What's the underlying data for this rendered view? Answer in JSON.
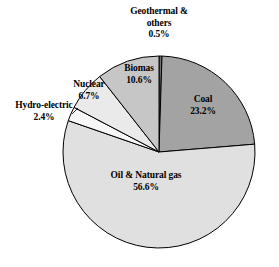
{
  "chart_data": {
    "type": "pie",
    "title": "",
    "subtitle": "",
    "xlabel": "",
    "ylabel": "",
    "legend_position": "none",
    "grid": false,
    "labels_inline": true,
    "unit": "%",
    "start_angle_deg": 0,
    "direction": "clockwise",
    "categories": [
      "Geothermal & others",
      "Coal",
      "Oil & Natural gas",
      "Hydro-electric",
      "Nuclear",
      "Biomas"
    ],
    "values": [
      0.5,
      23.2,
      56.6,
      2.4,
      6.7,
      10.6
    ],
    "slices": [
      {
        "name": "Geothermal & others",
        "label_line1": "Geothermal &",
        "label_line2": "others",
        "value": 0.5,
        "value_text": "0.5%",
        "color": "#6e6e6e",
        "label_placement": "outside-top"
      },
      {
        "name": "Coal",
        "label_line1": "Coal",
        "label_line2": "",
        "value": 23.2,
        "value_text": "23.2%",
        "color": "#a3a3a3",
        "label_placement": "inside"
      },
      {
        "name": "Oil & Natural gas",
        "label_line1": "Oil & Natural gas",
        "label_line2": "",
        "value": 56.6,
        "value_text": "56.6%",
        "color": "#e0e0e0",
        "label_placement": "inside"
      },
      {
        "name": "Hydro-electric",
        "label_line1": "Hydro-electric",
        "label_line2": "",
        "value": 2.4,
        "value_text": "2.4%",
        "color": "#f7f7f7",
        "label_placement": "outside-left"
      },
      {
        "name": "Nuclear",
        "label_line1": "Nuclear",
        "label_line2": "",
        "value": 6.7,
        "value_text": "6.7%",
        "color": "#eaeaea",
        "label_placement": "inside"
      },
      {
        "name": "Biomas",
        "label_line1": "Biomas",
        "label_line2": "",
        "value": 10.6,
        "value_text": "10.6%",
        "color": "#c6c6c6",
        "label_placement": "inside"
      }
    ],
    "geometry": {
      "center_x": 159,
      "center_y": 152,
      "radius": 96
    },
    "colors": {
      "background": "#ffffff",
      "outline": "#000000",
      "text": "#000000"
    }
  }
}
